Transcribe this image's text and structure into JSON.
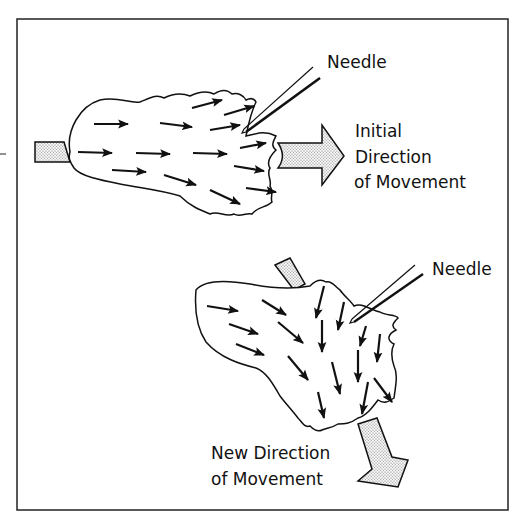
{
  "figure": {
    "top_panel": {
      "needle_label": "Needle",
      "direction_label_lines": [
        "Initial",
        "Direction",
        "of Movement"
      ]
    },
    "bottom_panel": {
      "needle_label": "Needle",
      "direction_label_lines": [
        "New Direction",
        "of Movement"
      ]
    },
    "colors": {
      "ink": "#111111",
      "background": "#ffffff",
      "stipple": "#d8d8d8"
    }
  }
}
